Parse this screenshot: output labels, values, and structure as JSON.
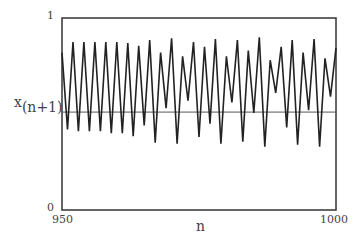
{
  "chart_data": {
    "type": "line",
    "title": "",
    "xlabel": "n",
    "ylabel": "x(n+1)",
    "ylabel_base": "x",
    "ylabel_sub": "(n+1)",
    "xlim": [
      950,
      1000
    ],
    "ylim": [
      0,
      1
    ],
    "x_tick_labels": [
      "950",
      "1000"
    ],
    "y_tick_labels": [
      "0",
      "1"
    ],
    "grid": false,
    "legend": null,
    "reference_line": {
      "type": "horizontal",
      "y": 0.51
    },
    "x": [
      950,
      951,
      952,
      953,
      954,
      955,
      956,
      957,
      958,
      959,
      960,
      961,
      962,
      963,
      964,
      965,
      966,
      967,
      968,
      969,
      970,
      971,
      972,
      973,
      974,
      975,
      976,
      977,
      978,
      979,
      980,
      981,
      982,
      983,
      984,
      985,
      986,
      987,
      988,
      989,
      990,
      991,
      992,
      993,
      994,
      995,
      996,
      997,
      998,
      999,
      1000
    ],
    "series": [
      {
        "name": "x(n+1)",
        "values": [
          0.82,
          0.42,
          0.875,
          0.41,
          0.875,
          0.41,
          0.875,
          0.41,
          0.875,
          0.4,
          0.875,
          0.4,
          0.87,
          0.385,
          0.855,
          0.44,
          0.885,
          0.35,
          0.82,
          0.53,
          0.895,
          0.345,
          0.8,
          0.57,
          0.875,
          0.38,
          0.85,
          0.45,
          0.89,
          0.345,
          0.8,
          0.56,
          0.885,
          0.355,
          0.83,
          0.505,
          0.9,
          0.33,
          0.78,
          0.61,
          0.85,
          0.43,
          0.885,
          0.34,
          0.82,
          0.52,
          0.89,
          0.33,
          0.79,
          0.59,
          0.845
        ]
      }
    ]
  },
  "colors": {
    "frame": "#333333",
    "series": "#222222",
    "reference_line": "#555555",
    "text": "#444444"
  }
}
